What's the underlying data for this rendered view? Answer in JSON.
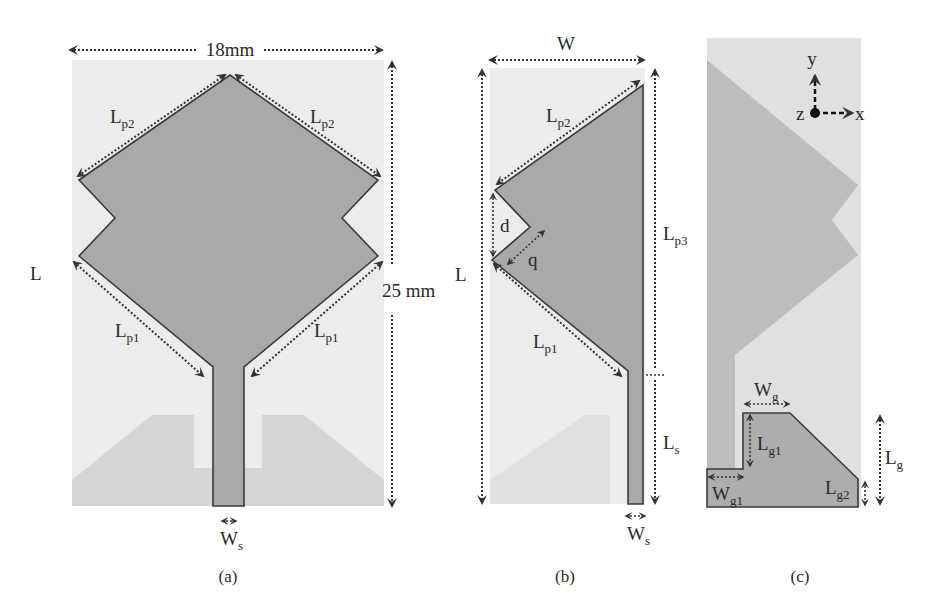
{
  "figure": {
    "panels": [
      {
        "id": "a",
        "caption": "(a)",
        "labels": {
          "width_dim": "18mm",
          "height_dim": "25 mm",
          "length": "L",
          "lp2_left": {
            "main": "L",
            "sub": "p2"
          },
          "lp2_right": {
            "main": "L",
            "sub": "p2"
          },
          "lp1_left": {
            "main": "L",
            "sub": "p1"
          },
          "lp1_right": {
            "main": "L",
            "sub": "p1"
          },
          "ws": {
            "main": "W",
            "sub": "s"
          }
        }
      },
      {
        "id": "b",
        "caption": "(b)",
        "labels": {
          "width": "W",
          "length": "L",
          "lp2": {
            "main": "L",
            "sub": "p2"
          },
          "lp3": {
            "main": "L",
            "sub": "p3"
          },
          "lp1": {
            "main": "L",
            "sub": "p1"
          },
          "d": "d",
          "q": "q",
          "ls": {
            "main": "L",
            "sub": "s"
          },
          "ws": {
            "main": "W",
            "sub": "s"
          }
        }
      },
      {
        "id": "c",
        "caption": "(c)",
        "labels": {
          "axis_y": "y",
          "axis_x": "x",
          "axis_z": "z",
          "wg": {
            "main": "W",
            "sub": "g"
          },
          "lg1": {
            "main": "L",
            "sub": "g1"
          },
          "wg1": {
            "main": "W",
            "sub": "g1"
          },
          "lg2": {
            "main": "L",
            "sub": "g2"
          },
          "lg": {
            "main": "L",
            "sub": "g"
          }
        }
      }
    ]
  }
}
